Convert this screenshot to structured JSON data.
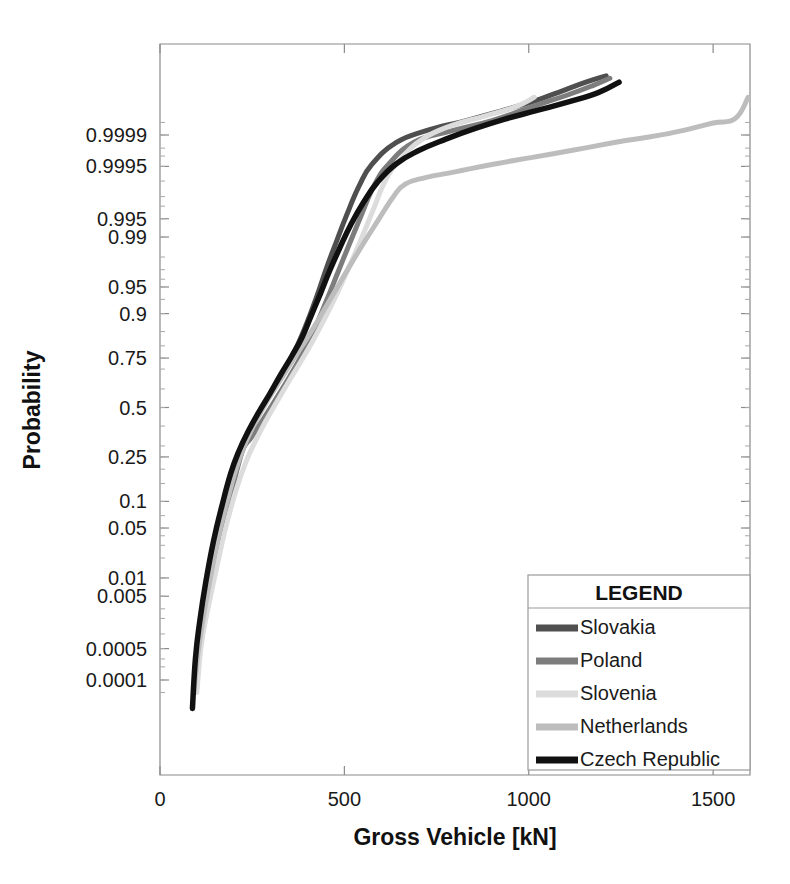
{
  "chart_data": {
    "type": "line",
    "title": "",
    "xlabel": "Gross Vehicle [kN]",
    "ylabel": "Probability",
    "scale": "normal-probability",
    "xlim": [
      0,
      1600
    ],
    "xticks": [
      0,
      500,
      1000,
      1500
    ],
    "xticklabels": [
      "0",
      "500",
      "1000",
      "1500"
    ],
    "yticklabels": [
      "0.9999",
      "0.9995",
      "0.995",
      "0.99",
      "0.95",
      "0.9",
      "0.75",
      "0.5",
      "0.25",
      "0.1",
      "0.05",
      "0.01",
      "0.005",
      "0.0005",
      "0.0001"
    ],
    "yticks": [
      0.9999,
      0.9995,
      0.995,
      0.99,
      0.95,
      0.9,
      0.75,
      0.5,
      0.25,
      0.1,
      0.05,
      0.01,
      0.005,
      0.0005,
      0.0001
    ],
    "grid": false,
    "legend_position": "lower-right",
    "series": [
      {
        "name": "Slovakia",
        "color": "#4f4f4f",
        "width": 5,
        "points": [
          [
            95,
            5e-05
          ],
          [
            105,
            0.0004
          ],
          [
            118,
            0.002
          ],
          [
            132,
            0.009
          ],
          [
            150,
            0.035
          ],
          [
            170,
            0.085
          ],
          [
            196,
            0.18
          ],
          [
            215,
            0.27
          ],
          [
            238,
            0.35
          ],
          [
            262,
            0.44
          ],
          [
            290,
            0.54
          ],
          [
            318,
            0.63
          ],
          [
            345,
            0.72
          ],
          [
            372,
            0.8
          ],
          [
            398,
            0.875
          ],
          [
            425,
            0.935
          ],
          [
            452,
            0.972
          ],
          [
            478,
            0.988
          ],
          [
            505,
            0.9955
          ],
          [
            540,
            0.99875
          ],
          [
            575,
            0.99955
          ],
          [
            640,
            0.99985
          ],
          [
            720,
            0.99992
          ],
          [
            830,
            0.999955
          ],
          [
            930,
            0.999975
          ],
          [
            1010,
            0.999985
          ],
          [
            1095,
            0.9999925
          ],
          [
            1155,
            0.9999955
          ],
          [
            1210,
            0.999997
          ]
        ]
      },
      {
        "name": "Poland",
        "color": "#7d7d7d",
        "width": 5,
        "points": [
          [
            95,
            5e-05
          ],
          [
            108,
            0.0005
          ],
          [
            125,
            0.0028
          ],
          [
            145,
            0.012
          ],
          [
            168,
            0.045
          ],
          [
            192,
            0.115
          ],
          [
            212,
            0.215
          ],
          [
            228,
            0.295
          ],
          [
            245,
            0.335
          ],
          [
            268,
            0.4
          ],
          [
            292,
            0.475
          ],
          [
            320,
            0.565
          ],
          [
            352,
            0.665
          ],
          [
            385,
            0.765
          ],
          [
            418,
            0.855
          ],
          [
            450,
            0.925
          ],
          [
            482,
            0.967
          ],
          [
            512,
            0.9865
          ],
          [
            545,
            0.9955
          ],
          [
            580,
            0.99875
          ],
          [
            620,
            0.99955
          ],
          [
            690,
            0.999855
          ],
          [
            790,
            0.99992
          ],
          [
            900,
            0.999955
          ],
          [
            1010,
            0.99998
          ],
          [
            1105,
            0.99999
          ],
          [
            1175,
            0.9999945
          ],
          [
            1220,
            0.9999965
          ]
        ]
      },
      {
        "name": "Slovenia",
        "color": "#dcdcdc",
        "width": 5,
        "points": [
          [
            100,
            5e-05
          ],
          [
            112,
            0.0006
          ],
          [
            130,
            0.003
          ],
          [
            152,
            0.013
          ],
          [
            178,
            0.05
          ],
          [
            205,
            0.125
          ],
          [
            232,
            0.225
          ],
          [
            258,
            0.32
          ],
          [
            285,
            0.42
          ],
          [
            315,
            0.525
          ],
          [
            348,
            0.635
          ],
          [
            382,
            0.735
          ],
          [
            415,
            0.82
          ],
          [
            448,
            0.89
          ],
          [
            480,
            0.94
          ],
          [
            512,
            0.972
          ],
          [
            545,
            0.989
          ],
          [
            578,
            0.9965
          ],
          [
            612,
            0.99905
          ],
          [
            652,
            0.99965
          ],
          [
            712,
            0.999875
          ],
          [
            790,
            0.99994
          ],
          [
            880,
            0.999965
          ],
          [
            965,
            0.99998
          ],
          [
            1015,
            0.9999885
          ]
        ]
      },
      {
        "name": "Netherlands",
        "color": "#bdbdbd",
        "width": 5,
        "points": [
          [
            92,
            5e-05
          ],
          [
            103,
            0.0004
          ],
          [
            118,
            0.0022
          ],
          [
            136,
            0.0095
          ],
          [
            158,
            0.038
          ],
          [
            182,
            0.1
          ],
          [
            205,
            0.195
          ],
          [
            226,
            0.29
          ],
          [
            248,
            0.38
          ],
          [
            272,
            0.47
          ],
          [
            298,
            0.56
          ],
          [
            326,
            0.645
          ],
          [
            356,
            0.73
          ],
          [
            388,
            0.805
          ],
          [
            420,
            0.868
          ],
          [
            452,
            0.918
          ],
          [
            485,
            0.953
          ],
          [
            518,
            0.975
          ],
          [
            552,
            0.9875
          ],
          [
            590,
            0.9945
          ],
          [
            632,
            0.99795
          ],
          [
            665,
            0.99885
          ],
          [
            720,
            0.99915
          ],
          [
            800,
            0.99935
          ],
          [
            900,
            0.999545
          ],
          [
            1010,
            0.99968
          ],
          [
            1130,
            0.999785
          ],
          [
            1240,
            0.999855
          ],
          [
            1330,
            0.99989
          ],
          [
            1420,
            0.9999225
          ],
          [
            1500,
            0.9999485
          ],
          [
            1560,
            0.99996
          ],
          [
            1595,
            0.9999885
          ]
        ]
      },
      {
        "name": "Czech Republic",
        "color": "#111111",
        "width": 5.5,
        "points": [
          [
            88,
            2e-05
          ],
          [
            96,
            0.0003
          ],
          [
            108,
            0.0018
          ],
          [
            124,
            0.0085
          ],
          [
            145,
            0.034
          ],
          [
            168,
            0.09
          ],
          [
            192,
            0.185
          ],
          [
            215,
            0.28
          ],
          [
            240,
            0.375
          ],
          [
            268,
            0.475
          ],
          [
            298,
            0.575
          ],
          [
            328,
            0.675
          ],
          [
            358,
            0.76
          ],
          [
            385,
            0.83
          ],
          [
            410,
            0.895
          ],
          [
            435,
            0.94
          ],
          [
            460,
            0.969
          ],
          [
            488,
            0.9855
          ],
          [
            518,
            0.9938
          ],
          [
            552,
            0.99745
          ],
          [
            590,
            0.99895
          ],
          [
            640,
            0.999555
          ],
          [
            700,
            0.99977
          ],
          [
            775,
            0.999875
          ],
          [
            855,
            0.99993
          ],
          [
            935,
            0.9999585
          ],
          [
            1020,
            0.9999745
          ],
          [
            1110,
            0.999985
          ],
          [
            1190,
            0.9999915
          ],
          [
            1245,
            0.9999955
          ]
        ]
      }
    ]
  },
  "legend": {
    "title": "LEGEND",
    "entries": [
      {
        "label": "Slovakia",
        "color": "#4f4f4f"
      },
      {
        "label": "Poland",
        "color": "#7d7d7d"
      },
      {
        "label": "Slovenia",
        "color": "#dcdcdc"
      },
      {
        "label": "Netherlands",
        "color": "#bdbdbd"
      },
      {
        "label": "Czech Republic",
        "color": "#111111"
      }
    ]
  },
  "axes": {
    "x_title": "Gross Vehicle [kN]",
    "y_title": "Probability",
    "x_tick_labels": [
      "0",
      "500",
      "1000",
      "1500"
    ],
    "y_tick_labels": [
      "0.9999",
      "0.9995",
      "0.995",
      "0.99",
      "0.95",
      "0.9",
      "0.75",
      "0.5",
      "0.25",
      "0.1",
      "0.05",
      "0.01",
      "0.005",
      "0.0005",
      "0.0001"
    ]
  },
  "colors": {
    "axis": "#8a8a8a",
    "text": "#1a1a1a",
    "background": "#ffffff"
  }
}
